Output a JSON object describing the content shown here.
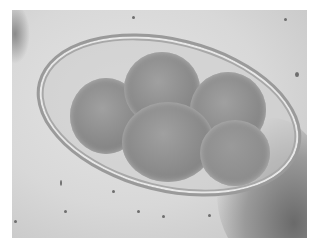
{
  "image": {
    "description": "Grayscale light-microscopy photograph of an oval egg with a thick transparent shell containing a multi-celled (roughly 5-lobed) granular embryo, surrounded by scattered debris particles",
    "colors": {
      "background": "#d8d8d8",
      "shell": "#9a9a9a",
      "embryo": "#8a8a8a",
      "margin": "#ffffff"
    }
  }
}
